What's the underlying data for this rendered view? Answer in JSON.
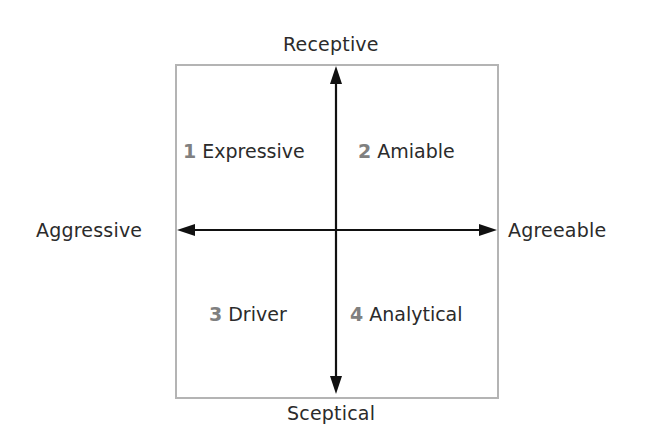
{
  "diagram": {
    "type": "quadrant",
    "colors": {
      "box_border": "#b4b4b4",
      "arrow": "#111111",
      "text": "#2b2b2b",
      "number": "#808080"
    },
    "axes": {
      "top": "Receptive",
      "bottom": "Sceptical",
      "left": "Aggressive",
      "right": "Agreeable"
    },
    "quadrants": [
      {
        "number": "1",
        "label": "Expressive",
        "position": "top-left"
      },
      {
        "number": "2",
        "label": "Amiable",
        "position": "top-right"
      },
      {
        "number": "3",
        "label": "Driver",
        "position": "bottom-left"
      },
      {
        "number": "4",
        "label": "Analytical",
        "position": "bottom-right"
      }
    ]
  }
}
